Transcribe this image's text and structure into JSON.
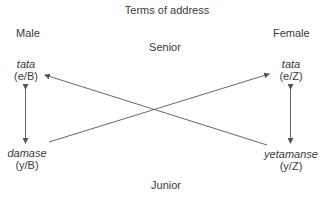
{
  "title": "Terms of address",
  "columns": {
    "left": "Male",
    "right": "Female"
  },
  "levels": {
    "top": "Senior",
    "bottom": "Junior"
  },
  "nodes": {
    "top_left": {
      "term": "tata",
      "code": "(e/B)"
    },
    "top_right": {
      "term": "tata",
      "code": "(e/Z)"
    },
    "bottom_left": {
      "term": "damase",
      "code": "(y/B)"
    },
    "bottom_right": {
      "term": "yetamanse",
      "code": "(y/Z)"
    }
  },
  "edges": [
    {
      "from": "top_left",
      "to": "bottom_left",
      "type": "bidirectional"
    },
    {
      "from": "top_right",
      "to": "bottom_right",
      "type": "bidirectional"
    },
    {
      "from": "bottom_left",
      "to": "top_right",
      "type": "directed"
    },
    {
      "from": "bottom_right",
      "to": "top_left",
      "type": "directed"
    }
  ],
  "colors": {
    "line": "#555555",
    "text": "#3a3a3a"
  }
}
